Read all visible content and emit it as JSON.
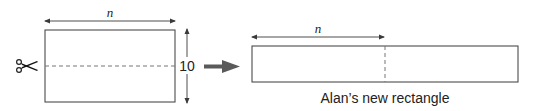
{
  "diagram": {
    "colors": {
      "line": "#3a3a3a",
      "arrow": "#5a5a5a",
      "dash": "#777777",
      "text": "#222222"
    },
    "original_rectangle": {
      "width_label": "n",
      "height_label": "10",
      "cut_icon": "scissors-icon"
    },
    "transform_arrow": "right-arrow-icon",
    "new_rectangle": {
      "width_label": "n",
      "caption": "Alan’s new rectangle"
    }
  }
}
